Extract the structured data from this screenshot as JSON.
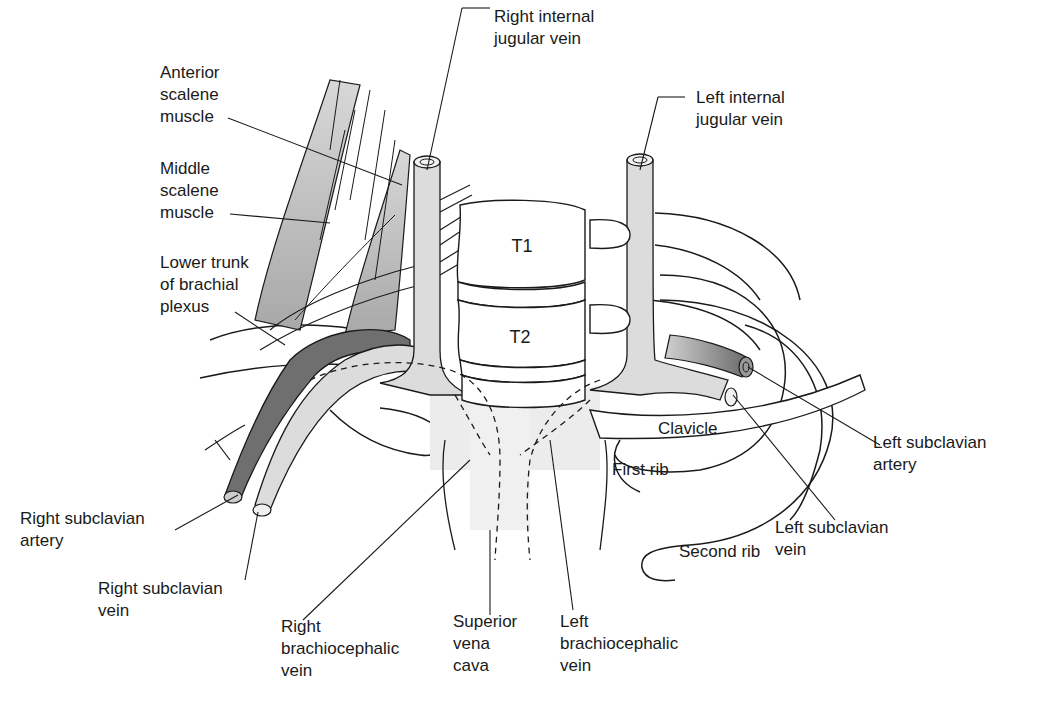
{
  "figure": {
    "type": "anatomical-diagram",
    "colors": {
      "background": "#ffffff",
      "line": "#1a1a1a",
      "vein_fill": "#dcdcdc",
      "artery_fill": "#777777",
      "muscle_fill": "#b8b8b8",
      "svc_fill": "#ececec"
    }
  },
  "labels": {
    "anterior_scalene": "Anterior\nscalene\nmuscle",
    "middle_scalene": "Middle\nscalene\nmuscle",
    "lower_trunk": "Lower trunk\nof brachial\nplexus",
    "right_ijv": "Right internal\njugular vein",
    "left_ijv": "Left internal\njugular vein",
    "right_subclavian_artery": "Right subclavian\nartery",
    "right_subclavian_vein": "Right subclavian\nvein",
    "right_brachiocephalic": "Right\nbrachiocephalic\nvein",
    "svc": "Superior\nvena\ncava",
    "left_brachiocephalic": "Left\nbrachiocephalic\nvein",
    "left_subclavian_artery": "Left subclavian\nartery",
    "left_subclavian_vein": "Left subclavian\nvein",
    "clavicle": "Clavicle",
    "first_rib": "First rib",
    "second_rib": "Second rib",
    "t1": "T1",
    "t2": "T2"
  }
}
